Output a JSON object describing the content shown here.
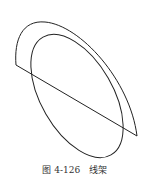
{
  "figure": {
    "caption": "图 4-126   线架",
    "stroke_color": "#222222",
    "background": "#ffffff"
  }
}
